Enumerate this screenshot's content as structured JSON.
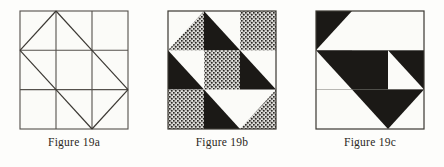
{
  "plate": {
    "background_color": "#fdfdfb",
    "ink_color": "#1b1916",
    "line_color": "#55514c",
    "stipple_color": "#2b2824",
    "paper_white": "#fbfbf8"
  },
  "panels": [
    {
      "id": "figure-19a",
      "caption": "Figure 19a",
      "style": "outline",
      "description": "Three-by-three square grid with an inscribed rotated square touching the midpoints of the grid edges.",
      "grid_divisions": 3,
      "regions": [
        {
          "name": "top-left-corner",
          "fill": "white"
        },
        {
          "name": "top-center",
          "fill": "white"
        },
        {
          "name": "top-right-corner",
          "fill": "white"
        },
        {
          "name": "middle-left",
          "fill": "white"
        },
        {
          "name": "center",
          "fill": "white"
        },
        {
          "name": "middle-right",
          "fill": "white"
        },
        {
          "name": "bottom-left-corner",
          "fill": "white"
        },
        {
          "name": "bottom-center",
          "fill": "white"
        },
        {
          "name": "bottom-right-corner",
          "fill": "white"
        }
      ]
    },
    {
      "id": "figure-19b",
      "caption": "Figure 19b",
      "style": "three-tone",
      "description": "Same geometry rendered as a pinwheel of black, white and stippled triangles with a stippled centre square.",
      "grid_divisions": 3,
      "regions": [
        {
          "name": "top-left-upper-triangle",
          "fill": "white"
        },
        {
          "name": "top-left-lower-triangle",
          "fill": "stipple"
        },
        {
          "name": "top-center-left-triangle",
          "fill": "black"
        },
        {
          "name": "top-center-right-triangle",
          "fill": "black"
        },
        {
          "name": "top-right-corner-square",
          "fill": "stipple"
        },
        {
          "name": "middle-left-square",
          "fill": "white"
        },
        {
          "name": "middle-left-triangle",
          "fill": "black"
        },
        {
          "name": "center-square",
          "fill": "stipple"
        },
        {
          "name": "middle-right-triangle",
          "fill": "black"
        },
        {
          "name": "middle-right-outer",
          "fill": "white"
        },
        {
          "name": "bottom-left-corner-square",
          "fill": "stipple"
        },
        {
          "name": "bottom-center-triangle",
          "fill": "black"
        },
        {
          "name": "bottom-center-white",
          "fill": "white"
        },
        {
          "name": "bottom-right-triangle",
          "fill": "stipple"
        },
        {
          "name": "bottom-right-white",
          "fill": "white"
        }
      ]
    },
    {
      "id": "figure-19c",
      "caption": "Figure 19c",
      "style": "two-tone",
      "description": "Same geometry rendered only in black and white, producing a rotational pinwheel.",
      "grid_divisions": 3,
      "regions": [
        {
          "name": "top-left-corner",
          "fill": "black"
        },
        {
          "name": "top-center-left-triangle",
          "fill": "white"
        },
        {
          "name": "top-center-right-triangle",
          "fill": "white"
        },
        {
          "name": "top-right-corner-square",
          "fill": "white"
        },
        {
          "name": "middle-left-square",
          "fill": "black"
        },
        {
          "name": "middle-left-triangle",
          "fill": "white"
        },
        {
          "name": "center-square",
          "fill": "black"
        },
        {
          "name": "middle-right-triangle",
          "fill": "white"
        },
        {
          "name": "middle-right-outer",
          "fill": "black"
        },
        {
          "name": "bottom-left-corner-square",
          "fill": "white"
        },
        {
          "name": "bottom-center-triangle",
          "fill": "white"
        },
        {
          "name": "bottom-center-black",
          "fill": "black"
        },
        {
          "name": "bottom-right-triangle",
          "fill": "white"
        }
      ]
    }
  ]
}
